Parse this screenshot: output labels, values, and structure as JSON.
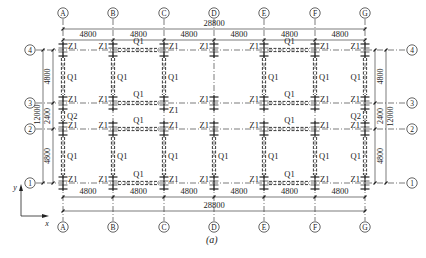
{
  "figure": {
    "caption": "(a)",
    "colors": {
      "line": "#222222",
      "background": "#ffffff"
    }
  },
  "axes_x": [
    {
      "label": "A",
      "x": 63
    },
    {
      "label": "B",
      "x": 113
    },
    {
      "label": "C",
      "x": 164
    },
    {
      "label": "D",
      "x": 214
    },
    {
      "label": "E",
      "x": 264
    },
    {
      "label": "F",
      "x": 315
    },
    {
      "label": "G",
      "x": 365
    }
  ],
  "axes_y": [
    {
      "label": "4",
      "y": 50
    },
    {
      "label": "3",
      "y": 103
    },
    {
      "label": "2",
      "y": 129
    },
    {
      "label": "1",
      "y": 183
    }
  ],
  "dimensions": {
    "top_total": "28800",
    "top_spans": [
      "4800",
      "4800",
      "4800",
      "4800",
      "4800",
      "4800"
    ],
    "bottom_spans": [
      "4800",
      "4800",
      "4800",
      "4800",
      "4800",
      "4800"
    ],
    "bottom_total": "28800",
    "left_spans": [
      "4800",
      "2400",
      "4800"
    ],
    "left_total": "12000",
    "right_spans": [
      "4800",
      "2400",
      "4800"
    ],
    "right_total": "12000"
  },
  "labels": {
    "column": "Z1",
    "wall_main": "Q1",
    "wall_corridor": "Q2",
    "coord_x": "x",
    "coord_y": "y"
  },
  "walls_horizontal": [
    {
      "row": "4",
      "from": "B",
      "to": "C",
      "label": "Q1"
    },
    {
      "row": "4",
      "from": "E",
      "to": "F",
      "label": "Q1"
    },
    {
      "row": "3",
      "from": "B",
      "to": "C",
      "label": "Q1"
    },
    {
      "row": "3",
      "from": "E",
      "to": "F",
      "label": "Q1"
    },
    {
      "row": "2",
      "from": "B",
      "to": "C",
      "label": "Q1"
    },
    {
      "row": "2",
      "from": "E",
      "to": "F",
      "label": "Q1"
    },
    {
      "row": "1",
      "from": "B",
      "to": "C",
      "label": "Q1"
    },
    {
      "row": "1",
      "from": "E",
      "to": "F",
      "label": "Q1"
    }
  ],
  "walls_vertical": [
    {
      "col": "A",
      "from": "4",
      "to": "3",
      "label": "Q1"
    },
    {
      "col": "B",
      "from": "4",
      "to": "3",
      "label": "Q1"
    },
    {
      "col": "C",
      "from": "4",
      "to": "3",
      "label": "Q1"
    },
    {
      "col": "E",
      "from": "4",
      "to": "3",
      "label": "Q1"
    },
    {
      "col": "F",
      "from": "4",
      "to": "3",
      "label": "Q1"
    },
    {
      "col": "G",
      "from": "4",
      "to": "3",
      "label": "Q1"
    },
    {
      "col": "A",
      "from": "3",
      "to": "2",
      "label": "Q2"
    },
    {
      "col": "G",
      "from": "3",
      "to": "2",
      "label": "Q2"
    },
    {
      "col": "A",
      "from": "2",
      "to": "1",
      "label": "Q1"
    },
    {
      "col": "B",
      "from": "2",
      "to": "1",
      "label": "Q1"
    },
    {
      "col": "C",
      "from": "2",
      "to": "1",
      "label": "Q1"
    },
    {
      "col": "D",
      "from": "2",
      "to": "1",
      "label": "Q1"
    },
    {
      "col": "E",
      "from": "2",
      "to": "1",
      "label": "Q1"
    },
    {
      "col": "F",
      "from": "2",
      "to": "1",
      "label": "Q1"
    },
    {
      "col": "G",
      "from": "2",
      "to": "1",
      "label": "Q1"
    }
  ]
}
